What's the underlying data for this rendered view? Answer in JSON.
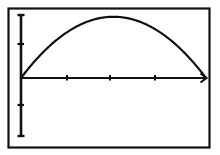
{
  "figure": {
    "name": "parabolic-arch-graph",
    "background_color": "#ffffff",
    "ink_color": "#111111",
    "frame": {
      "label": "plot-frame",
      "x": 8.5,
      "y": 8.5,
      "width": 201,
      "height": 139,
      "stroke_width": 2.2
    },
    "axes": {
      "x_axis": {
        "label": "x-axis",
        "y": 78,
        "x_start": 21,
        "x_end": 206,
        "stroke_width": 2.2,
        "arrow": "right",
        "ticks": [
          67,
          110,
          155
        ],
        "tick_half_height": 3,
        "tick_labels": [
          "",
          "",
          ""
        ]
      },
      "y_axis": {
        "label": "y-axis",
        "x": 21,
        "y_start": 14,
        "y_end": 137,
        "stroke_width": 2.6,
        "serif_top": true,
        "serif_bottom": true,
        "serif_half_width": 4,
        "ticks": [
          44,
          105
        ],
        "tick_half_width": 3,
        "tick_labels": [
          "",
          ""
        ]
      }
    }
  },
  "chart_data": {
    "type": "line",
    "title": "",
    "subtitle": "",
    "xlabel": "",
    "ylabel": "",
    "grid": false,
    "legend": null,
    "axis_ranges": {
      "x_pixels": [
        21,
        206
      ],
      "y_pixels": [
        137,
        14
      ]
    },
    "series": [
      {
        "name": "arch-curve",
        "description": "downward-opening parabolic arch from left origin to right x-intercept",
        "stroke_color": "#111111",
        "stroke_width": 2.2,
        "x": [
          0.0,
          0.05,
          0.1,
          0.15,
          0.2,
          0.25,
          0.3,
          0.35,
          0.4,
          0.45,
          0.5,
          0.55,
          0.6,
          0.65,
          0.7,
          0.75,
          0.8,
          0.85,
          0.9,
          0.95,
          1.0
        ],
        "values": [
          0.0,
          0.19,
          0.36,
          0.51,
          0.64,
          0.75,
          0.84,
          0.91,
          0.96,
          0.99,
          1.0,
          0.99,
          0.96,
          0.91,
          0.84,
          0.75,
          0.64,
          0.51,
          0.36,
          0.19,
          0.0
        ],
        "points_px": [
          [
            21,
            78
          ],
          [
            30.25,
            66.4
          ],
          [
            39.5,
            56.0
          ],
          [
            48.75,
            46.9
          ],
          [
            58,
            39.0
          ],
          [
            67.25,
            32.3
          ],
          [
            76.5,
            26.8
          ],
          [
            85.75,
            22.5
          ],
          [
            95,
            19.5
          ],
          [
            104.25,
            17.7
          ],
          [
            108,
            17.0
          ],
          [
            113.5,
            17.7
          ],
          [
            122.75,
            19.5
          ],
          [
            132,
            22.5
          ],
          [
            141.25,
            26.8
          ],
          [
            150.5,
            32.3
          ],
          [
            159.75,
            39.0
          ],
          [
            169,
            46.9
          ],
          [
            178.25,
            56.0
          ],
          [
            187.5,
            66.4
          ],
          [
            196.75,
            72.0
          ],
          [
            206,
            78
          ]
        ],
        "peak_px": [
          108,
          17
        ],
        "x_intercepts_px": [
          [
            21,
            78
          ],
          [
            206,
            78
          ]
        ]
      }
    ]
  }
}
